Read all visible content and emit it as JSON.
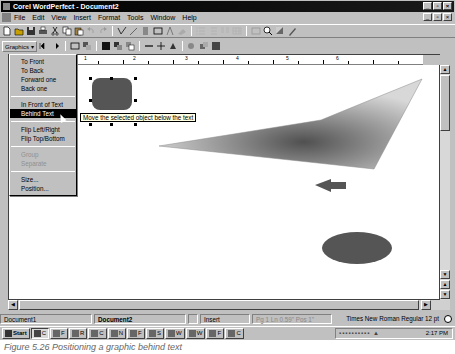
{
  "window": {
    "title": "Corel WordPerfect - Document2",
    "controls": {
      "minimize": "_",
      "restore": "▫",
      "close": "×"
    }
  },
  "menubar": {
    "items": [
      {
        "label": "File",
        "accel": "F"
      },
      {
        "label": "Edit",
        "accel": "E"
      },
      {
        "label": "View",
        "accel": "V"
      },
      {
        "label": "Insert",
        "accel": "I"
      },
      {
        "label": "Format",
        "accel": "o"
      },
      {
        "label": "Tools",
        "accel": "T"
      },
      {
        "label": "Window",
        "accel": "W"
      },
      {
        "label": "Help",
        "accel": "H"
      }
    ]
  },
  "toolbar1": {
    "icons": [
      "new-icon",
      "open-icon",
      "save-icon",
      "print-icon",
      "cut-icon",
      "copy-icon",
      "paste-icon",
      "undo-icon",
      "redo-icon",
      "spellcheck-icon",
      "pen-icon",
      "highlight-icon",
      "rectangle-icon",
      "text-icon",
      "fill-icon",
      "bullets-icon",
      "numbering-icon",
      "columns-icon",
      "table-icon",
      "quickview-icon",
      "zoom-icon",
      "shadow-icon",
      "pencil-icon"
    ]
  },
  "toolbar2": {
    "graphics_label": "Graphics ▾",
    "icons": [
      "prev-object-icon",
      "next-object-icon",
      "border-icon",
      "wrap-icon",
      "fill-icon",
      "front-icon",
      "back-icon",
      "line-icon",
      "crosshair-icon",
      "caption-icon",
      "copy-object-icon",
      "paste-object-icon",
      "properties-icon"
    ]
  },
  "graphics_menu": {
    "items": [
      {
        "label": "To Front",
        "state": "normal"
      },
      {
        "label": "To Back",
        "state": "normal"
      },
      {
        "label": "Forward one",
        "state": "normal"
      },
      {
        "label": "Back one",
        "state": "normal"
      },
      {
        "sep": true
      },
      {
        "label": "In Front of Text",
        "state": "normal"
      },
      {
        "label": "Behind Text",
        "state": "selected"
      },
      {
        "sep": true
      },
      {
        "label": "Flip Left/Right",
        "state": "normal"
      },
      {
        "label": "Flip Top/Bottom",
        "state": "normal"
      },
      {
        "sep": true
      },
      {
        "label": "Group",
        "state": "disabled"
      },
      {
        "label": "Separate",
        "state": "disabled"
      },
      {
        "sep": true
      },
      {
        "label": "Size...",
        "state": "normal"
      },
      {
        "label": "Position...",
        "state": "normal"
      }
    ]
  },
  "tooltip": "Move the selected object below the text",
  "ruler": {
    "numbers": [
      "1",
      "2",
      "3",
      "4",
      "5",
      "6"
    ]
  },
  "canvas": {
    "shapes": [
      {
        "type": "rounded-rect",
        "color": "#555555",
        "selected": true
      },
      {
        "type": "polygon-gradient",
        "color_from": "#e8e8e8",
        "color_to": "#555555"
      },
      {
        "type": "left-arrow",
        "color": "#555555"
      },
      {
        "type": "ellipse",
        "color": "#555555"
      }
    ]
  },
  "statusbar": {
    "doc1": "Document1",
    "doc2": "Document2",
    "mode": "Insert",
    "position": "Pg 1 Ln 0.59\" Pos 1\"",
    "font": "Times New Roman Regular 12 pt"
  },
  "taskbar": {
    "start": "Start",
    "buttons": [
      "C",
      "F",
      "R",
      "C",
      "N",
      "F",
      "S",
      "W",
      "W",
      "F",
      "C"
    ],
    "time": "2:17 PM"
  },
  "caption": "Figure 5.26  Positioning a graphic behind text"
}
